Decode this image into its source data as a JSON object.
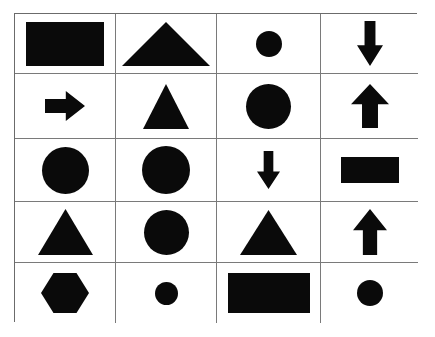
{
  "figure": {
    "background_color": "#ffffff",
    "shape_color": "#0a0a0a",
    "grid_line_color": "#7a7a7a",
    "border_color": "#6b6b6b",
    "rows": 5,
    "columns": 4
  },
  "chart_data": {
    "type": "table",
    "xlabel": "",
    "ylabel": "",
    "grid": true,
    "legend": "none",
    "rows": 5,
    "columns": 4,
    "categories": [
      "Column 1",
      "Column 2",
      "Column 3",
      "Column 4"
    ],
    "cells": [
      [
        {
          "shape": "rectangle",
          "size": "large",
          "width": 78,
          "height": 44,
          "orientation": "horizontal"
        },
        {
          "shape": "triangle",
          "size": "large",
          "width": 88,
          "height": 44,
          "orientation": "up"
        },
        {
          "shape": "circle",
          "size": "small",
          "width": 26,
          "height": 26,
          "orientation": "none"
        },
        {
          "shape": "arrow",
          "size": "medium",
          "width": 26,
          "height": 45,
          "orientation": "down"
        }
      ],
      [
        {
          "shape": "arrow",
          "size": "small",
          "width": 40,
          "height": 30,
          "orientation": "right"
        },
        {
          "shape": "triangle",
          "size": "medium",
          "width": 46,
          "height": 45,
          "orientation": "up"
        },
        {
          "shape": "circle",
          "size": "medium",
          "width": 45,
          "height": 45,
          "orientation": "none"
        },
        {
          "shape": "arrow",
          "size": "medium",
          "width": 38,
          "height": 44,
          "orientation": "up"
        }
      ],
      [
        {
          "shape": "circle",
          "size": "medium",
          "width": 47,
          "height": 47,
          "orientation": "none"
        },
        {
          "shape": "circle",
          "size": "medium",
          "width": 48,
          "height": 48,
          "orientation": "none"
        },
        {
          "shape": "arrow",
          "size": "small",
          "width": 23,
          "height": 38,
          "orientation": "down"
        },
        {
          "shape": "rectangle",
          "size": "medium",
          "width": 58,
          "height": 26,
          "orientation": "horizontal"
        }
      ],
      [
        {
          "shape": "triangle",
          "size": "medium",
          "width": 55,
          "height": 46,
          "orientation": "up"
        },
        {
          "shape": "circle",
          "size": "medium",
          "width": 45,
          "height": 45,
          "orientation": "none"
        },
        {
          "shape": "triangle",
          "size": "medium",
          "width": 57,
          "height": 45,
          "orientation": "up"
        },
        {
          "shape": "arrow",
          "size": "medium",
          "width": 34,
          "height": 46,
          "orientation": "up"
        }
      ],
      [
        {
          "shape": "hexagon",
          "size": "medium",
          "width": 48,
          "height": 40,
          "orientation": "flat-top"
        },
        {
          "shape": "circle",
          "size": "small",
          "width": 23,
          "height": 23,
          "orientation": "none"
        },
        {
          "shape": "rectangle",
          "size": "large",
          "width": 82,
          "height": 40,
          "orientation": "horizontal"
        },
        {
          "shape": "circle",
          "size": "small",
          "width": 26,
          "height": 26,
          "orientation": "none"
        }
      ]
    ]
  }
}
